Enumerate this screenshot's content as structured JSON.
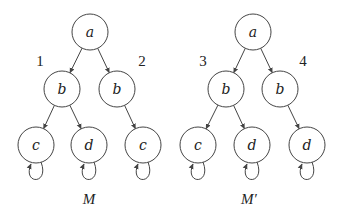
{
  "diagrams": [
    {
      "id": "M",
      "caption": "M",
      "nodes": [
        {
          "id": "a",
          "label": "a"
        },
        {
          "id": "b1",
          "label": "b"
        },
        {
          "id": "b2",
          "label": "b"
        },
        {
          "id": "c1",
          "label": "c"
        },
        {
          "id": "d1",
          "label": "d"
        },
        {
          "id": "c2",
          "label": "c"
        }
      ],
      "edges": [
        {
          "from": "a",
          "to": "b1"
        },
        {
          "from": "a",
          "to": "b2"
        },
        {
          "from": "b1",
          "to": "c1"
        },
        {
          "from": "b1",
          "to": "d1"
        },
        {
          "from": "b2",
          "to": "c2"
        }
      ],
      "self_loops": [
        "c1",
        "d1",
        "c2"
      ],
      "branch_labels": [
        {
          "near": "b1",
          "text": "1"
        },
        {
          "near": "b2",
          "text": "2"
        }
      ]
    },
    {
      "id": "M-prime",
      "caption": "M′",
      "nodes": [
        {
          "id": "a",
          "label": "a"
        },
        {
          "id": "b1",
          "label": "b"
        },
        {
          "id": "b2",
          "label": "b"
        },
        {
          "id": "c1",
          "label": "c"
        },
        {
          "id": "d1",
          "label": "d"
        },
        {
          "id": "d2",
          "label": "d"
        }
      ],
      "edges": [
        {
          "from": "a",
          "to": "b1"
        },
        {
          "from": "a",
          "to": "b2"
        },
        {
          "from": "b1",
          "to": "c1"
        },
        {
          "from": "b1",
          "to": "d1"
        },
        {
          "from": "b2",
          "to": "d2"
        }
      ],
      "self_loops": [
        "c1",
        "d1",
        "d2"
      ],
      "branch_labels": [
        {
          "near": "b1",
          "text": "3"
        },
        {
          "near": "b2",
          "text": "4"
        }
      ]
    }
  ]
}
